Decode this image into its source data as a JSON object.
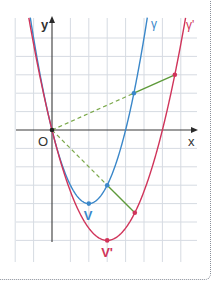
{
  "figure": {
    "title_fragment": "",
    "axes": {
      "x_label": "x",
      "y_label": "y",
      "origin_label": "O"
    },
    "grid": {
      "x_range": [
        -2,
        8
      ],
      "y_range": [
        -7,
        6
      ],
      "unit": 1
    },
    "curves": [
      {
        "id": "gamma",
        "label": "γ",
        "color": "#3a87c9",
        "equation": "y = x^2 - 4x",
        "a": 1,
        "h": 2,
        "k": -4
      },
      {
        "id": "gamma-prime",
        "label": "γ'",
        "color": "#d0345a",
        "equation": "y = (2/3)(x - 3)^2 - 6",
        "a": 0.6667,
        "h": 3,
        "k": -6
      }
    ],
    "vertices": [
      {
        "label": "V",
        "x": 2,
        "y": -4,
        "color": "#3a87c9"
      },
      {
        "label": "V'",
        "x": 3,
        "y": -6,
        "color": "#d0345a"
      }
    ],
    "homothety": {
      "center": "O",
      "ratio": 1.5,
      "dashed_color": "#7aa84a",
      "solid_color": "#5e9a3a",
      "pairs": [
        {
          "from": [
            4.45,
            2.0
          ],
          "to": [
            6.675,
            3.0
          ]
        },
        {
          "from": [
            3,
            -3
          ],
          "to": [
            4.5,
            -4.5
          ]
        }
      ]
    }
  }
}
